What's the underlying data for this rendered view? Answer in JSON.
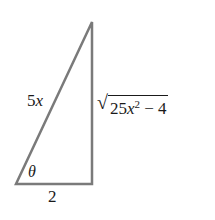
{
  "figure": {
    "type": "right-triangle",
    "stroke_color": "#7a7a7a",
    "vertices": {
      "top": [
        92,
        22
      ],
      "bottom_right": [
        92,
        184
      ],
      "bottom_left": [
        16,
        184
      ]
    },
    "labels": {
      "hypotenuse_coef": "5",
      "hypotenuse_var": "x",
      "base": "2",
      "angle": "θ",
      "opposite_radical": "√",
      "opposite_coef": "25",
      "opposite_var": "x",
      "opposite_exp": "2",
      "opposite_rest": " − 4"
    }
  }
}
